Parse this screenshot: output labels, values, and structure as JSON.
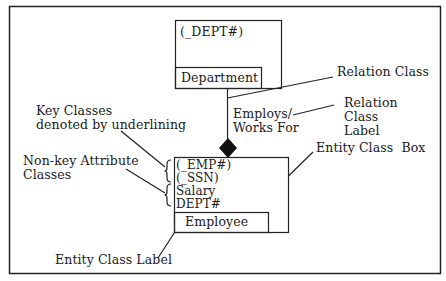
{
  "diagram": {
    "type": "entity-relationship-notation-legend",
    "colors": {
      "line": "#222222",
      "background": "#ffffff",
      "text": "#1a1a1a"
    },
    "department_box": {
      "attributes": [
        "(_DEPT#)"
      ],
      "label": "Department"
    },
    "employee_box": {
      "key_attributes": [
        "(_EMP#)",
        "(_SSN)"
      ],
      "nonkey_attributes": [
        "Salary",
        "DEPT#"
      ],
      "label": "Employee"
    },
    "relation": {
      "label_line1": "Employs/",
      "label_line2": "Works For",
      "symbol": "filled-diamond"
    },
    "annotations": {
      "relation_class": "Relation Class",
      "relation_class_label_1": "Relation",
      "relation_class_label_2": "Class",
      "relation_class_label_3": "Label",
      "key_classes_1": "Key Classes",
      "key_classes_2": "denoted by underlining",
      "nonkey_1": "Non-key Attribute",
      "nonkey_2": "Classes",
      "entity_class_box": "Entity Class  Box",
      "entity_class_label": "Entity Class Label"
    }
  }
}
